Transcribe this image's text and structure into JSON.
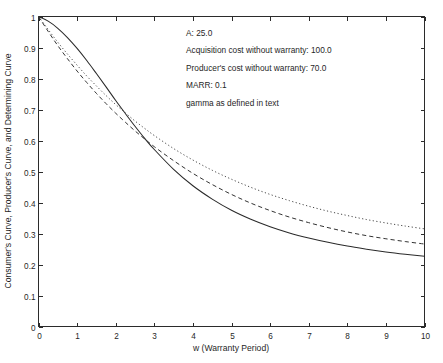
{
  "chart_data": {
    "type": "line",
    "title": "",
    "xlabel": "w (Warranty Period)",
    "ylabel": "Consumer's Curve, Producer's Curve, and Determining Curve",
    "xlim": [
      0,
      10
    ],
    "ylim": [
      0,
      1
    ],
    "grid": false,
    "legend": "none",
    "xticks": [
      "0",
      "1",
      "2",
      "3",
      "4",
      "5",
      "6",
      "7",
      "8",
      "9",
      "10"
    ],
    "yticks": [
      "0",
      "0.1",
      "0.2",
      "0.3",
      "0.4",
      "0.5",
      "0.6",
      "0.7",
      "0.8",
      "0.9",
      "1"
    ],
    "x": [
      0,
      0.25,
      0.5,
      0.75,
      1,
      1.25,
      1.5,
      1.75,
      2,
      2.25,
      2.5,
      2.75,
      3,
      3.5,
      4,
      4.5,
      5,
      5.5,
      6,
      6.5,
      7,
      7.5,
      8,
      8.5,
      9,
      9.5,
      10
    ],
    "series": [
      {
        "name": "Consumer's Curve",
        "style": "solid",
        "values": [
          1.0,
          0.985,
          0.962,
          0.932,
          0.897,
          0.858,
          0.816,
          0.773,
          0.729,
          0.687,
          0.646,
          0.607,
          0.571,
          0.507,
          0.454,
          0.411,
          0.375,
          0.346,
          0.322,
          0.302,
          0.2855,
          0.2715,
          0.2595,
          0.2495,
          0.2405,
          0.233,
          0.2265
        ]
      },
      {
        "name": "Producer's Curve",
        "style": "dashed",
        "values": [
          1.0,
          0.952,
          0.906,
          0.864,
          0.824,
          0.787,
          0.752,
          0.719,
          0.688,
          0.659,
          0.631,
          0.605,
          0.58,
          0.535,
          0.494,
          0.458,
          0.426,
          0.398,
          0.374,
          0.353,
          0.335,
          0.319,
          0.305,
          0.293,
          0.283,
          0.274,
          0.266
        ]
      },
      {
        "name": "Determining Curve",
        "style": "dotted",
        "values": [
          1.0,
          0.958,
          0.917,
          0.879,
          0.843,
          0.808,
          0.776,
          0.745,
          0.716,
          0.689,
          0.663,
          0.639,
          0.616,
          0.574,
          0.537,
          0.504,
          0.475,
          0.449,
          0.426,
          0.406,
          0.388,
          0.372,
          0.358,
          0.345,
          0.334,
          0.324,
          0.315
        ]
      }
    ]
  },
  "annotations": {
    "lines": [
      "A:  25.0",
      "Acquisition cost without warranty: 100.0",
      "Producer's cost without warranty:  70.0",
      "MARR:   0.1",
      "gamma as defined in text"
    ]
  }
}
